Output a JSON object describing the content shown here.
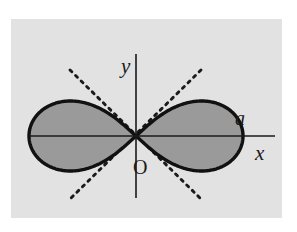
{
  "figure": {
    "kind": "lemniscate-plot",
    "canvas": {
      "width": 297,
      "height": 232
    },
    "panel": {
      "x": 11,
      "y": 19,
      "width": 271,
      "height": 199,
      "background_color": "#e2e2e2",
      "outer_background_color": "#ffffff"
    },
    "colors": {
      "curve_fill": "#9a9a9a",
      "curve_stroke": "#111111",
      "axis_stroke": "#1a1a1a",
      "dash_stroke": "#1a1a1a",
      "label_color": "#1a1a1a"
    },
    "origin": {
      "x": 136,
      "y": 136
    },
    "axes": {
      "x_axis": {
        "x1": 29,
        "y1": 136,
        "x2": 275,
        "y2": 136,
        "stroke_width": 1.6
      },
      "y_axis": {
        "x1": 136,
        "y1": 54,
        "x2": 136,
        "y2": 198,
        "stroke_width": 1.6
      }
    },
    "curve": {
      "type": "lemniscate",
      "half_width": 107,
      "max_height": 35,
      "stroke_width": 3.4,
      "right_tip_x": 228,
      "left_tip_x": 29,
      "top_y": 101,
      "bottom_y": 171
    },
    "asymptotes": [
      {
        "name": "tangent-up-right",
        "x1": 70,
        "y1": 70,
        "x2": 201,
        "y2": 199
      },
      {
        "name": "tangent-up-left",
        "x1": 201,
        "y1": 70,
        "x2": 70,
        "y2": 199
      }
    ],
    "dash_pattern": "2.6 5.2",
    "dash_width": 2.9,
    "labels": {
      "y_axis": {
        "text": "y",
        "x": 121,
        "y": 73,
        "font_size": 21,
        "italic": true
      },
      "x_axis": {
        "text": "x",
        "x": 255,
        "y": 160,
        "font_size": 21,
        "italic": true
      },
      "parameter_a": {
        "text": "a",
        "x": 235,
        "y": 125,
        "font_size": 20,
        "italic": true
      },
      "origin": {
        "text": "O",
        "x": 133,
        "y": 174,
        "font_size": 20,
        "italic": false
      }
    }
  }
}
